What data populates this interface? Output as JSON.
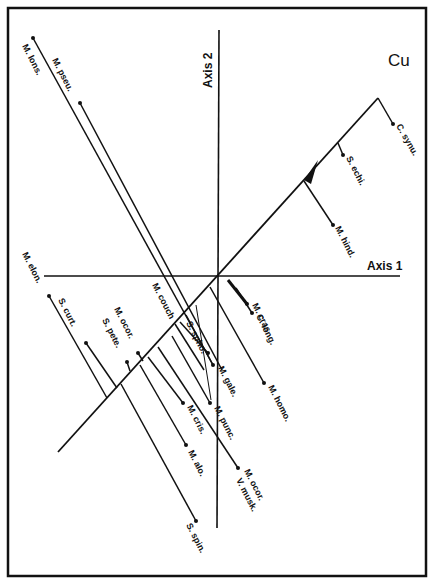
{
  "panel_label": "Cu",
  "axes": {
    "axis1_label": "Axis 1",
    "axis2_label": "Axis 2"
  },
  "colors": {
    "ink": "#111111",
    "background": "#ffffff"
  },
  "species": [
    {
      "id": "m-lons",
      "label": "M. lons."
    },
    {
      "id": "m-pseu",
      "label": "M. pseu."
    },
    {
      "id": "c-synu",
      "label": "C. synu."
    },
    {
      "id": "s-echi",
      "label": "S. echi."
    },
    {
      "id": "m-hind",
      "label": "M. hind."
    },
    {
      "id": "m-elon",
      "label": "M. elon."
    },
    {
      "id": "s-curt",
      "label": "S. curt."
    },
    {
      "id": "m-ocor-1",
      "label": "M. ocor."
    },
    {
      "id": "s-pete",
      "label": "S. pete."
    },
    {
      "id": "m-couch",
      "label": "M. couch"
    },
    {
      "id": "s-spho",
      "label": "S. spho."
    },
    {
      "id": "m-gale",
      "label": "M. gale."
    },
    {
      "id": "m-cras",
      "label": "M. cras."
    },
    {
      "id": "c-long",
      "label": "C. long."
    },
    {
      "id": "m-homo",
      "label": "M. homo."
    },
    {
      "id": "m-punc",
      "label": "M. punc."
    },
    {
      "id": "m-cris",
      "label": "M. cris."
    },
    {
      "id": "m-alo",
      "label": "M. alo."
    },
    {
      "id": "m-ocor-2",
      "label": "M. ocor."
    },
    {
      "id": "v-musk",
      "label": "V. musk."
    },
    {
      "id": "s-spin",
      "label": "S. spin."
    }
  ]
}
